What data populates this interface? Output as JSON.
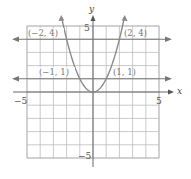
{
  "chart_data": {
    "type": "line",
    "title": "",
    "xlabel": "x",
    "ylabel": "y",
    "xlim": [
      -5,
      5
    ],
    "ylim": [
      -5,
      5
    ],
    "grid": true,
    "x_ticks": [
      {
        "value": -5,
        "label": "−5"
      },
      {
        "value": 5,
        "label": "5"
      }
    ],
    "y_ticks": [
      {
        "value": 5,
        "label": "5"
      },
      {
        "value": -5,
        "label": "−5"
      }
    ],
    "series": [
      {
        "name": "y = x^2",
        "kind": "parabola",
        "color": "#8a8a8a",
        "x": [
          -2.3,
          -2,
          -1,
          0,
          1,
          2,
          2.3
        ],
        "y": [
          5.29,
          4,
          1,
          0,
          1,
          4,
          5.29
        ]
      },
      {
        "name": "y = 4",
        "kind": "horizontal-line",
        "color": "#777777",
        "y": 4
      },
      {
        "name": "y = 1",
        "kind": "horizontal-line",
        "color": "#777777",
        "y": 1
      }
    ],
    "annotations": [
      {
        "text": "(−2, 4)",
        "x": -2,
        "y": 4
      },
      {
        "text": "(2, 4)",
        "x": 2,
        "y": 4
      },
      {
        "text": "(−1, 1)",
        "x": -1,
        "y": 1
      },
      {
        "text": "(1, 1)",
        "x": 1,
        "y": 1
      }
    ]
  },
  "labels": {
    "x_axis": "x",
    "y_axis": "y",
    "x_min": "−5",
    "x_max": "5",
    "y_max": "5",
    "y_min": "−5",
    "pt_neg2_4": "(−2, 4)",
    "pt_2_4": "(2, 4)",
    "pt_neg1_1": "(−1, 1)",
    "pt_1_1": "(1, 1)"
  }
}
